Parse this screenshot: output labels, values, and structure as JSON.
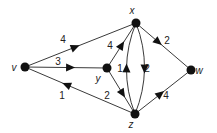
{
  "diagram": {
    "type": "directed-weighted-graph",
    "nodes": [
      {
        "id": "v",
        "label": "v",
        "x": 25,
        "y": 67,
        "lx": 14,
        "ly": 71
      },
      {
        "id": "x",
        "label": "x",
        "x": 136,
        "y": 23,
        "lx": 132,
        "ly": 14
      },
      {
        "id": "y",
        "label": "y",
        "x": 107,
        "y": 68,
        "lx": 98,
        "ly": 82
      },
      {
        "id": "z",
        "label": "z",
        "x": 135,
        "y": 114,
        "lx": 131,
        "ly": 128
      },
      {
        "id": "w",
        "label": "w",
        "x": 191,
        "y": 70,
        "lx": 199,
        "ly": 74
      }
    ],
    "edges": [
      {
        "from": "v",
        "to": "x",
        "weight": "4",
        "curve": 0,
        "t": 0.45,
        "lx": 63,
        "ly": 43
      },
      {
        "from": "v",
        "to": "y",
        "weight": "3",
        "curve": 0,
        "t": 0.55,
        "lx": 58,
        "ly": 65
      },
      {
        "from": "z",
        "to": "v",
        "weight": "1",
        "curve": 0,
        "t": 0.62,
        "lx": 62,
        "ly": 99
      },
      {
        "from": "y",
        "to": "x",
        "weight": "4",
        "curve": 0,
        "t": 0.5,
        "lx": 110,
        "ly": 49
      },
      {
        "from": "y",
        "to": "z",
        "weight": "2",
        "curve": 0,
        "t": 0.55,
        "lx": 107,
        "ly": 99
      },
      {
        "from": "x",
        "to": "z",
        "weight": "1",
        "curve": -9,
        "t": 0.5,
        "lx": 120,
        "ly": 72
      },
      {
        "from": "z",
        "to": "x",
        "weight": "2",
        "curve": -9,
        "t": 0.5,
        "lx": 147,
        "ly": 72
      },
      {
        "from": "x",
        "to": "w",
        "weight": "2",
        "curve": 0,
        "t": 0.4,
        "lx": 167,
        "ly": 44
      },
      {
        "from": "z",
        "to": "w",
        "weight": "4",
        "curve": 0,
        "t": 0.45,
        "lx": 166,
        "ly": 99
      }
    ],
    "colors": {
      "edge": "#3a3a3a",
      "node": "#111111",
      "text": "#222222",
      "background": "#ffffff"
    }
  }
}
